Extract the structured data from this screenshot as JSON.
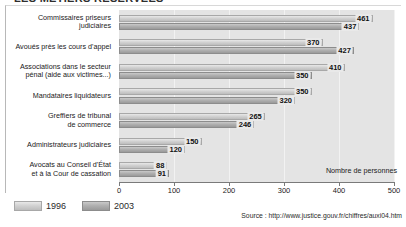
{
  "title": "LES MÉTIERS RÉSERVÉES",
  "axis_title": "Nombre de personnes",
  "source": "Source : http://www.justice.gouv.fr/chiffres/auxi04.htm",
  "legend": {
    "entries": [
      {
        "label": "1996",
        "key": "y1996",
        "color": "#d2d2d2"
      },
      {
        "label": "2003",
        "key": "y2003",
        "color": "#b0b0b0"
      }
    ]
  },
  "chart_data": {
    "type": "bar",
    "orientation": "horizontal",
    "title": "LES MÉTIERS RÉSERVÉES",
    "xlabel": "Nombre de personnes",
    "ylabel": "",
    "xlim": [
      0,
      500
    ],
    "xticks": [
      0,
      100,
      200,
      300,
      400,
      500
    ],
    "grid": true,
    "legend_position": "bottom-left",
    "categories": [
      "Commissaires priseurs\njudiciaires",
      "Avoués près les cours d'appel",
      "Associations dans le secteur\npénal (aide aux victimes...)",
      "Mandataires liquidateurs",
      "Greffiers de tribunal\nde commerce",
      "Administrateurs judiciaires",
      "Avocats au Conseil d'État\net à la Cour de cassation"
    ],
    "series": [
      {
        "name": "1996",
        "values": [
          461,
          370,
          410,
          350,
          265,
          150,
          88
        ]
      },
      {
        "name": "2003",
        "values": [
          437,
          427,
          350,
          320,
          246,
          120,
          91
        ]
      }
    ]
  }
}
